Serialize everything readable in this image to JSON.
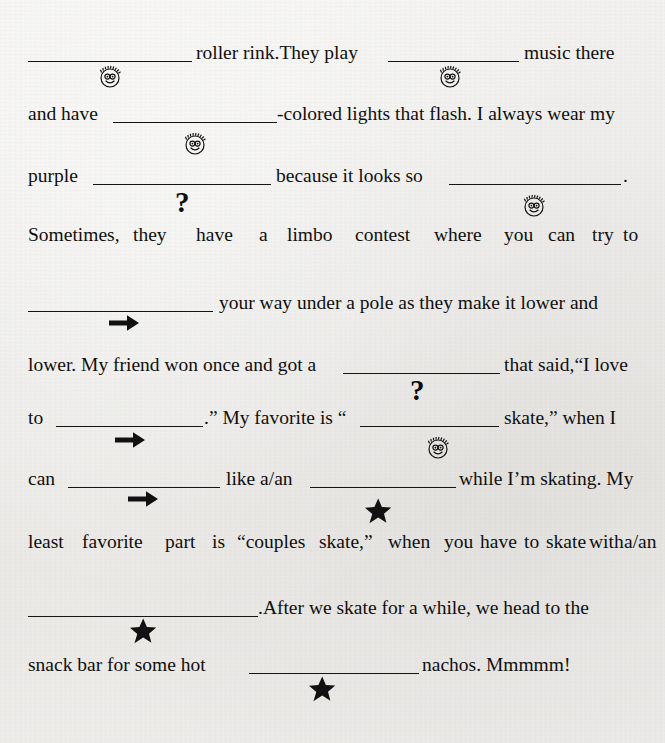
{
  "document": {
    "type": "fill-in-the-blank-story",
    "topic": "roller rink",
    "background_color": "#f2f1ef",
    "ink_color": "#100f0d"
  },
  "icons": {
    "smiley": "smiley-face-icon",
    "question": "question-mark-icon",
    "arrow": "right-arrow-icon",
    "star": "star-icon"
  },
  "lines": [
    {
      "id": "line1",
      "segments": [
        {
          "kind": "blank"
        },
        {
          "kind": "text",
          "value": "roller rink.They play"
        },
        {
          "kind": "blank"
        },
        {
          "kind": "text",
          "value": "music there"
        }
      ],
      "text_a": "roller rink.They play",
      "text_b": "music there"
    },
    {
      "id": "line2",
      "text_a": "and have",
      "text_b": "-colored lights that flash. I always wear my"
    },
    {
      "id": "line3",
      "text_a": "purple",
      "text_b": "because it looks so",
      "text_c": "."
    },
    {
      "id": "line4",
      "words": [
        "Sometimes,",
        "they",
        "have",
        "a",
        "limbo",
        "contest",
        "where",
        "you",
        "can",
        "try",
        "to"
      ]
    },
    {
      "id": "line5",
      "text_b": "your way under a pole as they make it lower and"
    },
    {
      "id": "line6",
      "text_a": "lower. My friend won once and got a",
      "text_b": "that said,“I love"
    },
    {
      "id": "line7",
      "text_a": "to",
      "text_b": ".” My favorite is “",
      "text_c": "skate,” when I"
    },
    {
      "id": "line8",
      "text_a": "can",
      "text_b": "like a/an",
      "text_c": "while I’m skating. My"
    },
    {
      "id": "line9",
      "words": [
        "least",
        "favorite",
        "part",
        "is",
        "“couples",
        "skate,”",
        "when",
        "you",
        "have",
        "to",
        "skate",
        "with",
        "a/an"
      ]
    },
    {
      "id": "line10",
      "text_b": ".After we skate for a while, we head to the"
    },
    {
      "id": "line11",
      "text_a": "snack bar for some hot",
      "text_b": "nachos. Mmmmm!"
    }
  ],
  "blanks": [
    {
      "id": "blank-1",
      "line": "line1",
      "hint": "smiley-face-icon"
    },
    {
      "id": "blank-2",
      "line": "line1",
      "hint": "smiley-face-icon"
    },
    {
      "id": "blank-3",
      "line": "line2",
      "hint": "smiley-face-icon"
    },
    {
      "id": "blank-4",
      "line": "line3",
      "hint": "question-mark-icon"
    },
    {
      "id": "blank-5",
      "line": "line3",
      "hint": "smiley-face-icon"
    },
    {
      "id": "blank-6",
      "line": "line5",
      "hint": "right-arrow-icon"
    },
    {
      "id": "blank-7",
      "line": "line6",
      "hint": "question-mark-icon"
    },
    {
      "id": "blank-8",
      "line": "line7",
      "hint": "right-arrow-icon"
    },
    {
      "id": "blank-9",
      "line": "line7",
      "hint": "smiley-face-icon"
    },
    {
      "id": "blank-10",
      "line": "line8",
      "hint": "right-arrow-icon"
    },
    {
      "id": "blank-11",
      "line": "line8",
      "hint": "star-icon"
    },
    {
      "id": "blank-12",
      "line": "line10",
      "hint": "star-icon"
    },
    {
      "id": "blank-13",
      "line": "line11",
      "hint": "star-icon"
    }
  ]
}
